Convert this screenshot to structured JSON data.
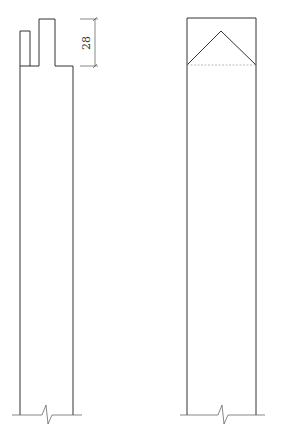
{
  "diagram": {
    "type": "technical-drawing",
    "views": [
      {
        "name": "side-view",
        "description": "Post with stepped top notch and break line at bottom",
        "dimension": {
          "label": "28",
          "orientation": "vertical"
        }
      },
      {
        "name": "front-view",
        "description": "Post with gabled (triangular) top and break line at bottom"
      }
    ]
  },
  "colors": {
    "line": "#333333",
    "hidden_line": "#aaaaaa",
    "background": "#ffffff"
  }
}
